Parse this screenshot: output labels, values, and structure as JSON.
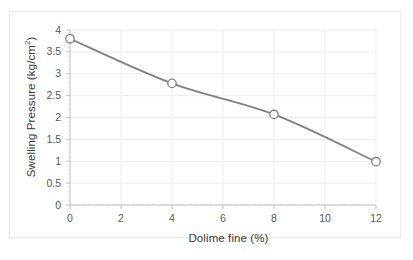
{
  "chart_data": {
    "type": "line",
    "title": "",
    "subtitle": "",
    "xlabel": "Dolime fine (%)",
    "ylabel_text": "Swelling Pressure (kg/cm",
    "ylabel_sup": "2",
    "ylabel_tail": ")",
    "ylabel_full": "Swelling Pressure (kg/cm2)",
    "x": [
      0,
      4,
      8,
      12
    ],
    "values": [
      3.8,
      2.78,
      2.07,
      0.99
    ],
    "series": [
      {
        "name": "Swelling Pressure",
        "values": [
          3.8,
          2.78,
          2.07,
          0.99
        ]
      }
    ],
    "xlim": [
      0,
      12
    ],
    "ylim": [
      0,
      4
    ],
    "xticks": [
      0,
      2,
      4,
      6,
      8,
      10,
      12
    ],
    "xtick_labels": [
      "0",
      "2",
      "4",
      "6",
      "8",
      "10",
      "12"
    ],
    "yticks": [
      0,
      0.5,
      1,
      1.5,
      2,
      2.5,
      3,
      3.5,
      4
    ],
    "ytick_labels": [
      "0",
      "0.5",
      "1",
      "1.5",
      "2",
      "2.5",
      "3",
      "3.5",
      "4"
    ],
    "grid": true,
    "legend": "none",
    "line_color": "#808080",
    "marker": "open-circle",
    "marker_edge_color": "#808080",
    "marker_face_color": "#ffffff",
    "grid_color": "#ededed",
    "axis_color": "#bfbfbf",
    "background": "#ffffff",
    "frame_color": "#e9e9e9"
  }
}
